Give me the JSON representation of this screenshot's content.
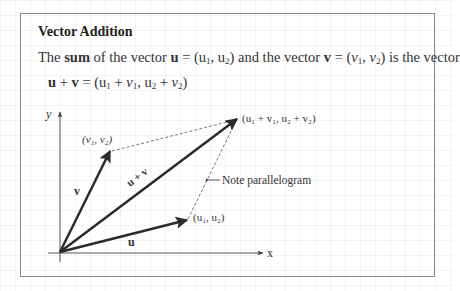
{
  "title": "Vector Addition",
  "definition": {
    "prefix": "The ",
    "sum_word": "sum",
    "part1": " of the vector ",
    "u_sym": "u",
    "u_eq": " = (u",
    "u1_sub": "1",
    "u_mid": ", u",
    "u2_sub": "2",
    "u_close": ")",
    "part2": " and the vector ",
    "v_sym": "v",
    "v_eq": " = (",
    "v_var1": "v",
    "v1_sub": "1",
    "v_mid": ", ",
    "v_var2": "v",
    "v2_sub": "2",
    "v_close": ")",
    "part3": " is the vector"
  },
  "formula": {
    "u_sym": "u",
    "plus": " + ",
    "v_sym": "v",
    "eq_open": " = (u",
    "s1": "1",
    "plus1": " + ",
    "v1": "v",
    "s1b": "1",
    "comma": ", u",
    "s2": "2",
    "plus2": " + ",
    "v2": "v",
    "s2b": "2",
    "close": ")"
  },
  "diagram": {
    "axis_x_label": "x",
    "axis_y_label": "y",
    "vector_u_label": "u",
    "vector_v_label": "v",
    "vector_sum_label": "u + v",
    "point_u_label": "(u₁, u₂)",
    "point_v_label": "(v₁, v₂)",
    "point_sum_label": "(u₁ + v₁,  u₂ + v₂)",
    "note_label": "Note parallelogram",
    "origin": [
      60,
      252
    ],
    "u_tip": [
      187,
      220
    ],
    "v_tip": [
      110,
      151
    ],
    "sum_tip": [
      237,
      119
    ],
    "colors": {
      "vector": "#2b2b2b",
      "axis": "#555555",
      "dashed": "#555555",
      "box_border": "#8a8a8a"
    }
  }
}
